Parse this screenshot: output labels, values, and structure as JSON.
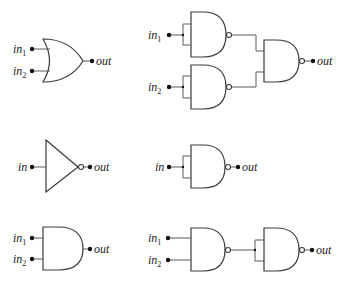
{
  "diagram": {
    "rows": [
      {
        "left": {
          "gate": "OR",
          "inputs": [
            "in1",
            "in2"
          ],
          "output": "out"
        },
        "right": {
          "gate": "NAND-based OR",
          "structure": "two NANDs with tied inputs feeding a NAND",
          "inputs": [
            "in1",
            "in2"
          ],
          "output": "out"
        }
      },
      {
        "left": {
          "gate": "NOT",
          "inputs": [
            "in"
          ],
          "output": "out"
        },
        "right": {
          "gate": "NAND with tied inputs",
          "inputs": [
            "in"
          ],
          "output": "out"
        }
      },
      {
        "left": {
          "gate": "AND",
          "inputs": [
            "in1",
            "in2"
          ],
          "output": "out"
        },
        "right": {
          "gate": "NAND-based AND",
          "structure": "NAND feeding a NAND with tied inputs",
          "inputs": [
            "in1",
            "in2"
          ],
          "output": "out"
        }
      }
    ]
  },
  "labels": {
    "in": "in",
    "out": "out",
    "sub1": "1",
    "sub2": "2"
  },
  "colors": {
    "stroke": "#3a3a3a",
    "wire": "#5a5a5a",
    "dot": "#111111",
    "background": "#ffffff"
  }
}
